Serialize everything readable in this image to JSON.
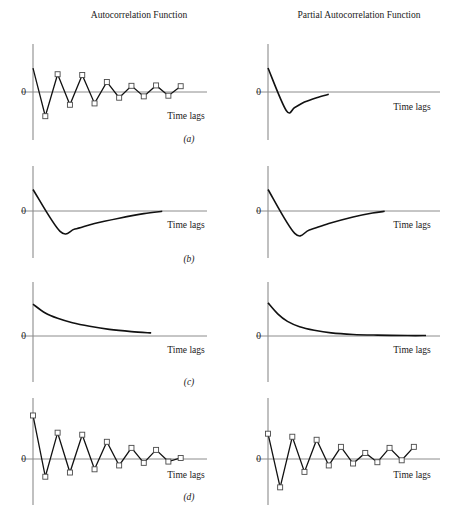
{
  "figure": {
    "width": 452,
    "height": 528,
    "background": "#ffffff",
    "line_color": "#111111",
    "axis_color": "#8c8c8c",
    "marker_face": "#ffffff",
    "marker_edge": "#4a4a4a",
    "column_titles": [
      "Autocorrelation Function",
      "Partial Autocorrelation Function"
    ],
    "zero_label": "0",
    "xaxis_label": "Time lags",
    "row_labels": [
      "(a)",
      "(b)",
      "(c)",
      "(d)"
    ]
  },
  "chart_data": [
    {
      "id": "acf-a",
      "type": "line",
      "title": "Autocorrelation Function",
      "panel": "(a)",
      "row": "a",
      "column": "left",
      "xlabel": "Time lags",
      "ylabel": "0",
      "grid": false,
      "legend": "none",
      "markers": true,
      "description": "Damped alternating sine-wave autocorrelation, starting positive at lag 0 and oscillating with decaying amplitude",
      "xlim": [
        0,
        13
      ],
      "ylim": [
        -1.05,
        1.05
      ],
      "x": [
        0,
        1,
        2,
        3,
        4,
        5,
        6,
        7,
        8,
        9,
        10,
        11,
        12
      ],
      "y": [
        0.62,
        -0.72,
        0.46,
        -0.38,
        0.44,
        -0.34,
        0.26,
        -0.17,
        0.16,
        -0.13,
        0.17,
        -0.11,
        0.15
      ],
      "marker_from_index": 1
    },
    {
      "id": "pacf-a",
      "type": "line",
      "title": "Partial Autocorrelation Function",
      "panel": "(a)",
      "row": "a",
      "column": "right",
      "xlabel": "Time lags",
      "ylabel": "0",
      "grid": false,
      "legend": "none",
      "markers": false,
      "description": "Single negative spike at low lag then smooth decay back toward zero; cuts off",
      "xlim": [
        0,
        13
      ],
      "ylim": [
        -1.05,
        1.05
      ],
      "x": [
        0,
        1.5,
        2.2,
        3.0,
        4.0,
        5.0
      ],
      "y": [
        0.62,
        -0.55,
        -0.46,
        -0.3,
        -0.17,
        -0.07
      ]
    },
    {
      "id": "acf-b",
      "type": "line",
      "title": "Autocorrelation Function",
      "panel": "(b)",
      "row": "b",
      "column": "left",
      "xlabel": "Time lags",
      "ylabel": "0",
      "grid": false,
      "legend": "none",
      "markers": false,
      "description": "Sharp drop to a negative minimum then slow exponential decay back up to zero",
      "xlim": [
        0,
        13
      ],
      "ylim": [
        -1.05,
        1.05
      ],
      "x": [
        0,
        2.2,
        3.4,
        5.0,
        7.0,
        9.0,
        10.5
      ],
      "y": [
        0.6,
        -0.62,
        -0.55,
        -0.38,
        -0.22,
        -0.08,
        -0.01
      ]
    },
    {
      "id": "pacf-b",
      "type": "line",
      "title": "Partial Autocorrelation Function",
      "panel": "(b)",
      "row": "b",
      "column": "right",
      "xlabel": "Time lags",
      "ylabel": "0",
      "grid": false,
      "legend": "none",
      "markers": false,
      "description": "Sharp drop to a negative minimum then exponential decay back to zero",
      "xlim": [
        0,
        13
      ],
      "ylim": [
        -1.05,
        1.05
      ],
      "x": [
        0,
        2.2,
        3.4,
        5.0,
        7.0,
        8.6,
        9.6
      ],
      "y": [
        0.6,
        -0.68,
        -0.58,
        -0.38,
        -0.18,
        -0.06,
        -0.01
      ]
    },
    {
      "id": "acf-c",
      "type": "line",
      "title": "Autocorrelation Function",
      "panel": "(c)",
      "row": "c",
      "column": "left",
      "xlabel": "Time lags",
      "ylabel": "0",
      "grid": false,
      "legend": "none",
      "markers": false,
      "description": "Monotonic slow exponential decay from a positive value toward zero, truncated before the axis end",
      "xlim": [
        0,
        13
      ],
      "ylim": [
        -0.15,
        1.05
      ],
      "x": [
        0,
        1.0,
        2.0,
        3.2,
        4.6,
        6.2,
        8.0,
        9.6
      ],
      "y": [
        0.72,
        0.52,
        0.4,
        0.3,
        0.22,
        0.15,
        0.1,
        0.07
      ]
    },
    {
      "id": "pacf-c",
      "type": "line",
      "title": "Partial Autocorrelation Function",
      "panel": "(c)",
      "row": "c",
      "column": "right",
      "xlabel": "Time lags",
      "ylabel": "0",
      "grid": false,
      "legend": "none",
      "markers": false,
      "description": "Rapid exponential decay from a positive value to zero, then flat along the axis",
      "xlim": [
        0,
        13
      ],
      "ylim": [
        -0.15,
        1.05
      ],
      "x": [
        0,
        0.8,
        1.6,
        2.6,
        3.8,
        5.2,
        7.0,
        9.0,
        11.5,
        13
      ],
      "y": [
        0.75,
        0.5,
        0.33,
        0.21,
        0.13,
        0.07,
        0.035,
        0.02,
        0.01,
        0.01
      ]
    },
    {
      "id": "acf-d",
      "type": "line",
      "title": "Autocorrelation Function",
      "panel": "(d)",
      "row": "d",
      "column": "left",
      "xlabel": "Time lags",
      "ylabel": "0",
      "grid": false,
      "legend": "none",
      "markers": true,
      "description": "Strongly damped alternating oscillation beginning at a high positive value at lag 0 and decaying toward zero",
      "xlim": [
        0,
        13
      ],
      "ylim": [
        -1.05,
        1.05
      ],
      "x": [
        0,
        1,
        2,
        3,
        4,
        5,
        6,
        7,
        8,
        9,
        10,
        11,
        12
      ],
      "y": [
        0.86,
        -0.55,
        0.52,
        -0.42,
        0.48,
        -0.32,
        0.34,
        -0.2,
        0.22,
        -0.12,
        0.18,
        -0.08,
        0.02
      ],
      "marker_from_index": 0
    },
    {
      "id": "pacf-d",
      "type": "line",
      "title": "Partial Autocorrelation Function",
      "panel": "(d)",
      "row": "d",
      "column": "right",
      "xlabel": "Time lags",
      "ylabel": "0",
      "grid": false,
      "legend": "none",
      "markers": true,
      "description": "Damped alternating oscillation with a large negative spike at lag 1, decaying toward zero",
      "xlim": [
        0,
        13
      ],
      "ylim": [
        -1.05,
        1.05
      ],
      "x": [
        0,
        1,
        2,
        3,
        4,
        5,
        6,
        7,
        8,
        9,
        10,
        11,
        12
      ],
      "y": [
        0.5,
        -0.88,
        0.44,
        -0.4,
        0.38,
        -0.2,
        0.24,
        -0.14,
        0.12,
        -0.1,
        0.22,
        -0.04,
        0.24
      ],
      "marker_from_index": 0
    }
  ],
  "layout": {
    "columns": [
      {
        "key": "left",
        "axis_x": 33,
        "zero_text_x": 26,
        "x_end_short": 207,
        "x_end_long": 207,
        "label_x": 186
      },
      {
        "key": "right",
        "axis_x": 268,
        "zero_text_x": 261,
        "x_end_short": 440,
        "x_end_long": 440,
        "label_x": 412
      }
    ],
    "rows": [
      {
        "key": "a",
        "zero_y": 92,
        "top_y": 50,
        "bottom_y": 140,
        "tl_y": 119,
        "tl_x_left": 186,
        "tl_x_right": 412,
        "panel_y": 141
      },
      {
        "key": "b",
        "zero_y": 211,
        "top_y": 172,
        "bottom_y": 258,
        "tl_y": 222,
        "tl_x_left": 186,
        "tl_x_right": 412,
        "panel_y": 262
      },
      {
        "key": "c",
        "zero_y": 336,
        "top_y": 288,
        "bottom_y": 382,
        "tl_y": 347,
        "tl_x_left": 186,
        "tl_x_right": 412,
        "panel_y": 384
      },
      {
        "key": "d",
        "zero_y": 459,
        "top_y": 404,
        "bottom_y": 505,
        "tl_y": 478,
        "tl_x_left": 186,
        "tl_x_right": 412,
        "panel_y": 499
      }
    ],
    "title_y": 18,
    "title_x_left": 139,
    "title_x_right": 359
  }
}
